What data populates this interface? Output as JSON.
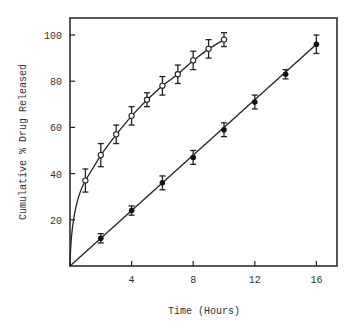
{
  "chart_data": {
    "type": "line",
    "title": "",
    "xlabel": "Time (Hours)",
    "ylabel": "Cumulative % Drug Released",
    "xlim": [
      0,
      17.3
    ],
    "ylim": [
      0,
      106
    ],
    "x_ticks": [
      4,
      8,
      12,
      16
    ],
    "y_ticks": [
      20,
      40,
      60,
      80,
      100
    ],
    "grid": false,
    "legend": null,
    "series": [
      {
        "name": "open-circles",
        "marker": "open-circle",
        "x": [
          1,
          2,
          3,
          4,
          5,
          6,
          7,
          8,
          9,
          10
        ],
        "values": [
          37,
          48,
          57,
          65,
          72,
          78,
          83,
          89,
          94,
          98
        ],
        "error": [
          5,
          5,
          4,
          4,
          3,
          4,
          4,
          4,
          4,
          3
        ],
        "curve": "concave from origin"
      },
      {
        "name": "filled-circles",
        "marker": "filled-circle",
        "x": [
          2,
          4,
          6,
          8,
          10,
          12,
          14,
          16
        ],
        "values": [
          12,
          24,
          36,
          47,
          59,
          71,
          83,
          96
        ],
        "error": [
          2,
          2,
          3,
          3,
          3,
          3,
          2,
          4
        ],
        "curve": "linear from origin"
      }
    ]
  }
}
